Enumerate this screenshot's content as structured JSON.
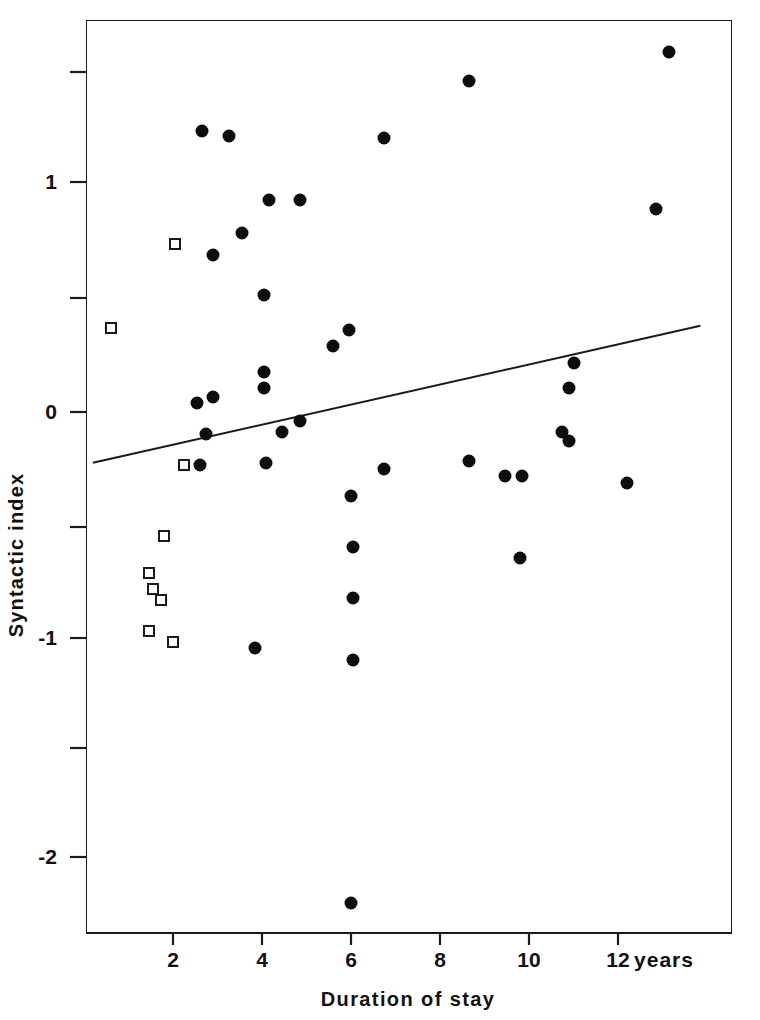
{
  "chart_data": {
    "type": "scatter",
    "title": "",
    "xlabel": "Duration of stay",
    "x_unit": "years",
    "ylabel": "Syntactic index",
    "xlim": [
      0.05,
      14.55
    ],
    "ylim": [
      -2.32,
      1.78
    ],
    "grid": false,
    "legend": "none",
    "x_ticks": [
      2,
      4,
      6,
      8,
      10,
      12
    ],
    "x_tick_labels": [
      "2",
      "4",
      "6",
      "8",
      "10",
      "12"
    ],
    "y_ticks": [
      1.5,
      1,
      0.5,
      0,
      -0.5,
      -1,
      -1.5,
      -2
    ],
    "y_tick_labels": [
      "",
      "1",
      "",
      "0",
      "",
      "-1",
      "",
      "-2"
    ],
    "y_major_ticks": [
      1,
      0,
      -1,
      -2
    ],
    "series": [
      {
        "name": "filled-circles",
        "marker": "filled-circle",
        "color": "#0d0d0d",
        "points": [
          [
            13.15,
            1.63
          ],
          [
            8.65,
            1.5
          ],
          [
            2.65,
            1.27
          ],
          [
            3.25,
            1.25
          ],
          [
            6.75,
            1.24
          ],
          [
            4.15,
            0.96
          ],
          [
            4.85,
            0.96
          ],
          [
            12.85,
            0.92
          ],
          [
            3.55,
            0.81
          ],
          [
            2.9,
            0.71
          ],
          [
            4.05,
            0.53
          ],
          [
            5.95,
            0.37
          ],
          [
            5.6,
            0.3
          ],
          [
            4.05,
            0.18
          ],
          [
            4.05,
            0.11
          ],
          [
            11.0,
            0.22
          ],
          [
            2.55,
            0.04
          ],
          [
            2.9,
            0.07
          ],
          [
            10.9,
            0.11
          ],
          [
            2.75,
            -0.1
          ],
          [
            4.45,
            -0.09
          ],
          [
            4.85,
            -0.04
          ],
          [
            10.75,
            -0.09
          ],
          [
            10.9,
            -0.13
          ],
          [
            2.6,
            -0.24
          ],
          [
            4.1,
            -0.23
          ],
          [
            6.75,
            -0.26
          ],
          [
            8.65,
            -0.22
          ],
          [
            9.45,
            -0.29
          ],
          [
            9.85,
            -0.29
          ],
          [
            12.2,
            -0.32
          ],
          [
            6.0,
            -0.38
          ],
          [
            6.05,
            -0.61
          ],
          [
            9.8,
            -0.66
          ],
          [
            6.05,
            -0.84
          ],
          [
            3.85,
            -1.07
          ],
          [
            6.05,
            -1.12
          ],
          [
            6.0,
            -2.22
          ]
        ]
      },
      {
        "name": "open-squares",
        "marker": "open-square",
        "color": "#1a1a1a",
        "points": [
          [
            2.05,
            0.76
          ],
          [
            0.6,
            0.38
          ],
          [
            2.25,
            -0.24
          ],
          [
            1.8,
            -0.56
          ],
          [
            1.45,
            -0.73
          ],
          [
            1.55,
            -0.8
          ],
          [
            1.45,
            -0.99
          ],
          [
            2.0,
            -1.04
          ],
          [
            1.72,
            -0.85
          ]
        ]
      }
    ],
    "trend_line": {
      "name": "regression-line",
      "x_start": 0.2,
      "y_start": -0.23,
      "x_end": 13.85,
      "y_end": 0.39,
      "color": "#1a1a1a"
    }
  }
}
